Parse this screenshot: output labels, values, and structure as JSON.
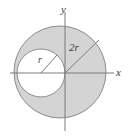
{
  "figure": {
    "name": "circle-geometry-diagram",
    "background_color": "#ffffff",
    "shaded_region_color": "#d4d4d4",
    "inner_region_color": "#ffffff",
    "stroke_color": "#8c8c8c",
    "axis_color": "#7a7a7a",
    "label_color": "#3a3a3a",
    "axes": {
      "x_label": "x",
      "y_label": "y",
      "origin_x": 65,
      "origin_y": 73,
      "x_min": 10,
      "x_max": 114,
      "y_min": 12,
      "y_max": 131
    },
    "outer_circle": {
      "name": "outer-circle",
      "center_x": 60,
      "center_y": 72,
      "radius": 46,
      "radius_label": "2r",
      "fill": "#d4d4d4"
    },
    "inner_circle": {
      "name": "inner-circle",
      "center_x": 41,
      "center_y": 73,
      "radius": 24,
      "radius_label": "r",
      "fill": "#ffffff"
    },
    "outer_radius_line": {
      "from_x": 65,
      "from_y": 73,
      "to_x": 99,
      "to_y": 40
    },
    "inner_radius_line": {
      "from_x": 41,
      "from_y": 73,
      "to_x": 57,
      "to_y": 55
    }
  }
}
